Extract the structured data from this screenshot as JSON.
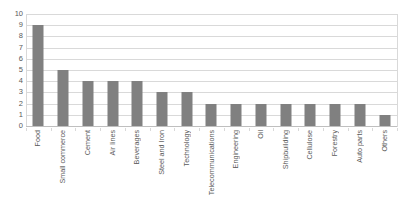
{
  "chart_data": {
    "type": "bar",
    "title": "",
    "subtitle": "",
    "xlabel": "",
    "ylabel": "",
    "ylim": [
      0,
      10
    ],
    "ytick_step": 1,
    "yticks": [
      10,
      9,
      8,
      7,
      6,
      5,
      4,
      3,
      2,
      1,
      0
    ],
    "grid": true,
    "grid_axis": "y",
    "legend": false,
    "legend_position": "none",
    "bar_color": "#808080",
    "grid_color": "#d9d9d9",
    "label_color": "#595959",
    "background_color": "#ffffff",
    "xtick_rotation": 90,
    "categories": [
      "Food",
      "Small commerce",
      "Cement",
      "Air lines",
      "Beverages",
      "Steel and Iron",
      "Technology",
      "Telecommunications",
      "Engineering",
      "Oil",
      "Shipbuilding",
      "Cellulose",
      "Forestry",
      "Auto parts",
      "Others"
    ],
    "values": [
      9,
      5,
      4,
      4,
      4,
      3,
      3,
      2,
      2,
      2,
      2,
      2,
      2,
      2,
      1
    ]
  }
}
